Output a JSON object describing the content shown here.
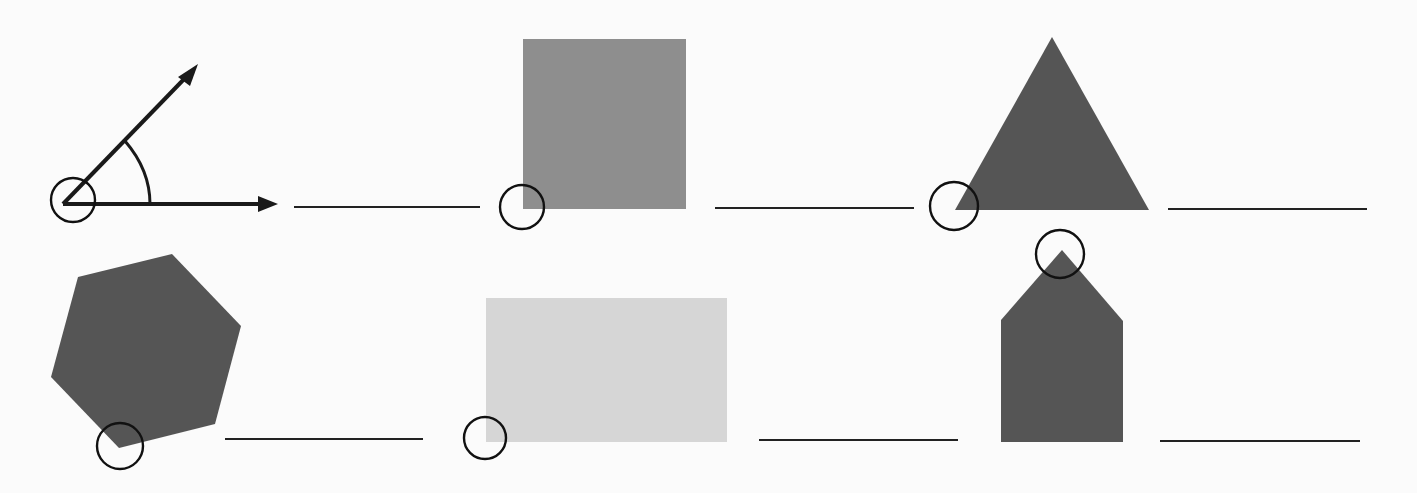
{
  "worksheet": {
    "type": "identify-the-circled-angle",
    "colors": {
      "background": "#fbfbfb",
      "ink": "#1a1a1a",
      "dark_fill": "#555555",
      "medium_fill": "#8e8e8e",
      "light_fill": "#d6d6d6"
    },
    "items": [
      {
        "shape": "angle-with-rays",
        "row": 1,
        "col": 1,
        "answer": ""
      },
      {
        "shape": "square",
        "row": 1,
        "col": 2,
        "answer": ""
      },
      {
        "shape": "triangle",
        "row": 1,
        "col": 3,
        "answer": ""
      },
      {
        "shape": "hexagon",
        "row": 2,
        "col": 1,
        "answer": ""
      },
      {
        "shape": "rectangle",
        "row": 2,
        "col": 2,
        "answer": ""
      },
      {
        "shape": "pentagon-house",
        "row": 2,
        "col": 3,
        "answer": ""
      }
    ]
  }
}
